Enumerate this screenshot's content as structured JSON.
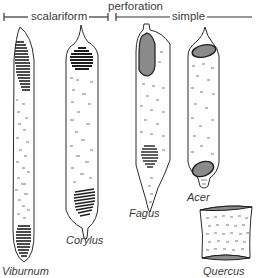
{
  "header": {
    "category_label": "perforation",
    "groups": [
      {
        "id": "scalariform",
        "label": "scalariform",
        "x_start": 4,
        "x_end": 108
      },
      {
        "id": "simple",
        "label": "simple",
        "x_start": 116,
        "x_end": 252
      }
    ]
  },
  "specimens": [
    {
      "id": "viburnum",
      "name": "Viburnum",
      "perforation_type": "scalariform"
    },
    {
      "id": "corylus",
      "name": "Corylus",
      "perforation_type": "scalariform"
    },
    {
      "id": "fagus",
      "name": "Fagus",
      "perforation_type": "simple"
    },
    {
      "id": "acer",
      "name": "Acer",
      "perforation_type": "simple"
    },
    {
      "id": "quercus",
      "name": "Quercus",
      "perforation_type": "simple"
    }
  ],
  "colors": {
    "outline": "#2a2a2a",
    "bars": "#1e1e1e",
    "plate_fill": "#8a8a8a",
    "pits": "#555555",
    "text": "#3a3a3a"
  }
}
